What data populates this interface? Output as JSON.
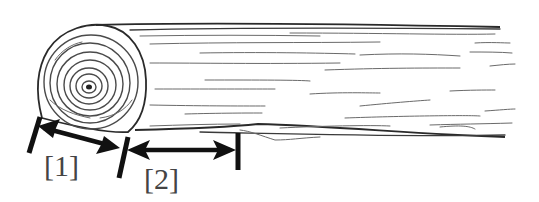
{
  "figure": {
    "colors": {
      "ink": "#111111",
      "line": "#4a4a4a",
      "background": "#ffffff"
    }
  },
  "dimensions": [
    {
      "id": "1",
      "label": "[1]",
      "meaning": "span across the log's end diameter"
    },
    {
      "id": "2",
      "label": "[2]",
      "meaning": "span along the log's length"
    }
  ]
}
